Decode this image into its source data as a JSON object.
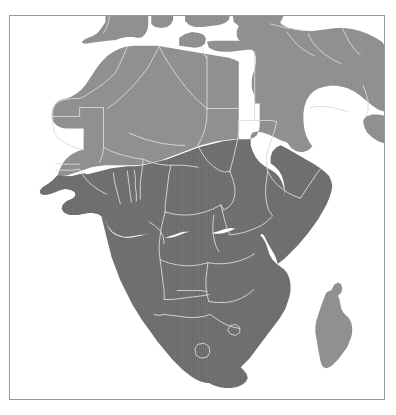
{
  "figure": {
    "type": "map",
    "title": "",
    "background_color": "#ffffff",
    "frame": {
      "visible": true,
      "border_color": "#9a9a9a",
      "x": 9,
      "y": 15,
      "width": 376,
      "height": 385
    }
  },
  "map": {
    "region": "Africa",
    "projection_extent": {
      "description": "Africa with southern Europe, Arabian Peninsula and Madagascar"
    },
    "legend": {
      "visible": false,
      "categories": [
        {
          "label": "Lighter shaded region",
          "color": "#8c8c8c"
        },
        {
          "label": "Darker shaded region",
          "color": "#6a6a6a"
        }
      ]
    },
    "styles": {
      "land_light": "#8c8c8c",
      "land_dark": "#6a6a6a",
      "land_mid": "#7d7d7d",
      "ocean": "#ffffff",
      "country_border": "#d9d9d9"
    },
    "areas": [
      {
        "name": "north-africa-sahara",
        "shade": "light"
      },
      {
        "name": "sub-saharan-africa",
        "shade": "dark"
      },
      {
        "name": "madagascar",
        "shade": "light"
      },
      {
        "name": "southern-europe",
        "shade": "light"
      },
      {
        "name": "arabian-peninsula",
        "shade": "light"
      },
      {
        "name": "middle-east",
        "shade": "light"
      }
    ]
  }
}
